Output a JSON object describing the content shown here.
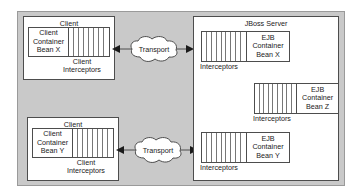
{
  "diagram": {
    "colors": {
      "panel_background": "#c9c9c9",
      "box_background": "#ffffff",
      "box_border": "#4d4d4d",
      "stripe_line": "#777777",
      "text": "#1a1a1a",
      "page_background": "#ffffff"
    }
  },
  "clients": [
    {
      "title": "Client",
      "bean_lines": [
        "Client",
        "Container",
        "Bean X"
      ],
      "interceptor_label_lines": [
        "Client",
        "Interceptors"
      ],
      "stripe_count": 8
    },
    {
      "title": "Client",
      "bean_lines": [
        "Client",
        "Container",
        "Bean Y"
      ],
      "interceptor_label_lines": [
        "Client",
        "Interceptors"
      ],
      "stripe_count": 8
    }
  ],
  "transports": [
    {
      "label": "Transport"
    },
    {
      "label": "Transport"
    }
  ],
  "server": {
    "title": "JBoss Server",
    "containers": [
      {
        "bean_lines": [
          "EJB",
          "Container",
          "Bean X"
        ],
        "interceptor_label": "Interceptors",
        "stripe_count": 9
      },
      {
        "bean_lines": [
          "EJB",
          "Container",
          "Bean Z"
        ],
        "interceptor_label": "Interceptors",
        "stripe_count": 9
      },
      {
        "bean_lines": [
          "EJB",
          "Container",
          "Bean Y"
        ],
        "interceptor_label": "Interceptors",
        "stripe_count": 9
      }
    ]
  },
  "arrows": [
    {
      "name": "transport-to-client-x",
      "direction": "left"
    },
    {
      "name": "transport-to-server-x",
      "direction": "right"
    },
    {
      "name": "transport-to-client-y",
      "direction": "left"
    },
    {
      "name": "transport-to-server-y",
      "direction": "right"
    }
  ]
}
